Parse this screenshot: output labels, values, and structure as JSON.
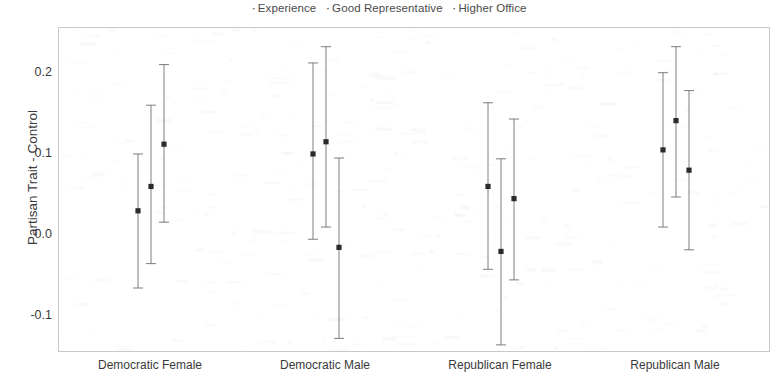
{
  "legend": {
    "position": "top-center",
    "marker": "·",
    "entries": [
      {
        "label": "Experience"
      },
      {
        "label": "Good Representative"
      },
      {
        "label": "Higher Office"
      }
    ]
  },
  "axes": {
    "ylabel": "Partisan Trait - Control",
    "xlabel": "",
    "yticks": [
      "0.2",
      "0.1",
      "0.0",
      "-0.1"
    ],
    "xticks": [
      "Democratic Female",
      "Democratic Male",
      "Republican Female",
      "Republican Male"
    ]
  },
  "style": {
    "line_color": "#6f6f6f",
    "point_color": "#2b2b2b",
    "frame_color": "#c8c8c8",
    "text_color": "#3a3a3a",
    "background": "#ffffff"
  },
  "chart_data": {
    "type": "scatter",
    "title": "",
    "subtitle": "",
    "xlabel": "",
    "ylabel": "Partisan Trait - Control",
    "ylim": [
      -0.145,
      0.255
    ],
    "yticks": [
      0.2,
      0.1,
      0.0,
      -0.1
    ],
    "grid": false,
    "legend_position": "top-center",
    "error_bars": "confidence interval with end caps",
    "categories": [
      "Democratic Female",
      "Democratic Male",
      "Republican Female",
      "Republican Male"
    ],
    "series": [
      {
        "name": "Experience",
        "values": [
          0.03,
          0.1,
          0.06,
          0.105
        ],
        "ci_low": [
          -0.065,
          -0.005,
          -0.042,
          0.01
        ],
        "ci_high": [
          0.1,
          0.212,
          0.163,
          0.2
        ]
      },
      {
        "name": "Good Representative",
        "values": [
          0.06,
          0.115,
          -0.02,
          0.141
        ],
        "ci_low": [
          -0.035,
          0.01,
          -0.135,
          0.047
        ],
        "ci_high": [
          0.16,
          0.232,
          0.094,
          0.232
        ]
      },
      {
        "name": "Higher Office",
        "values": [
          0.112,
          -0.015,
          0.045,
          0.08
        ],
        "ci_low": [
          0.016,
          -0.127,
          -0.055,
          -0.018
        ],
        "ci_high": [
          0.21,
          0.095,
          0.143,
          0.178
        ]
      }
    ]
  }
}
